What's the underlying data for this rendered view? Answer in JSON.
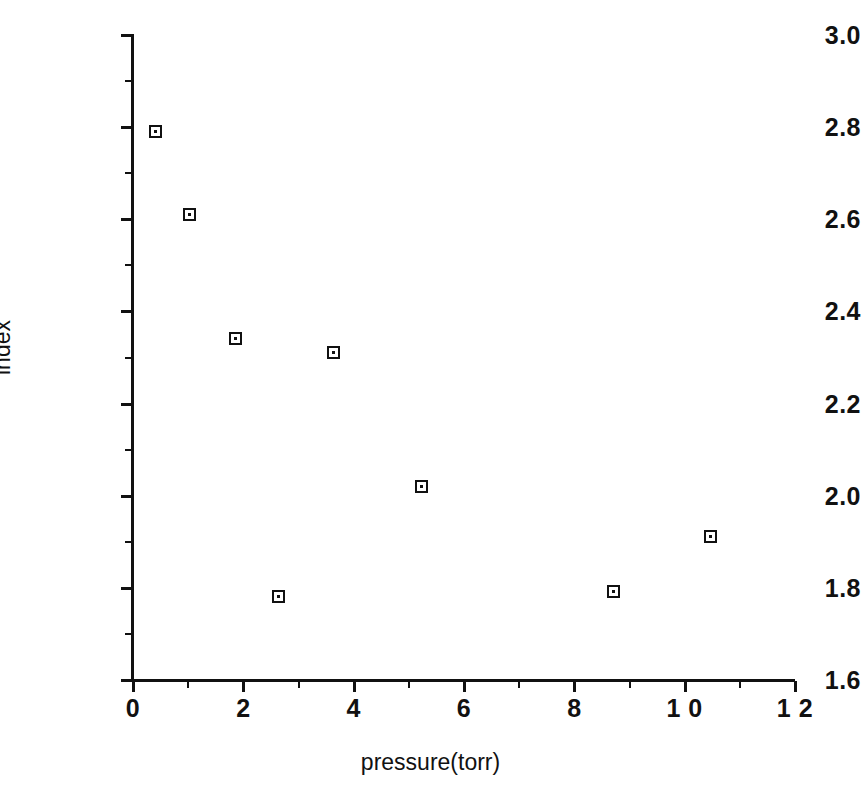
{
  "chart_data": {
    "type": "scatter",
    "title": "",
    "xlabel": "pressure(torr)",
    "ylabel": "index",
    "xlim": [
      0,
      12
    ],
    "ylim": [
      1.6,
      3.0
    ],
    "grid": false,
    "legend": null,
    "x_ticks": [
      {
        "value": 0,
        "label": "0",
        "minor": false
      },
      {
        "value": 1,
        "label": "",
        "minor": true
      },
      {
        "value": 2,
        "label": "2",
        "minor": false
      },
      {
        "value": 3,
        "label": "",
        "minor": true
      },
      {
        "value": 4,
        "label": "4",
        "minor": false
      },
      {
        "value": 5,
        "label": "",
        "minor": true
      },
      {
        "value": 6,
        "label": "6",
        "minor": false
      },
      {
        "value": 7,
        "label": "",
        "minor": true
      },
      {
        "value": 8,
        "label": "8",
        "minor": false
      },
      {
        "value": 9,
        "label": "",
        "minor": true
      },
      {
        "value": 10,
        "label": "1 0",
        "minor": false
      },
      {
        "value": 11,
        "label": "",
        "minor": true
      },
      {
        "value": 12,
        "label": "1 2",
        "minor": false
      }
    ],
    "y_ticks": [
      {
        "value": 1.6,
        "label": "1.6",
        "minor": false
      },
      {
        "value": 1.7,
        "label": "",
        "minor": true
      },
      {
        "value": 1.8,
        "label": "1.8",
        "minor": false
      },
      {
        "value": 1.9,
        "label": "",
        "minor": true
      },
      {
        "value": 2.0,
        "label": "2.0",
        "minor": false
      },
      {
        "value": 2.1,
        "label": "",
        "minor": true
      },
      {
        "value": 2.2,
        "label": "2.2",
        "minor": false
      },
      {
        "value": 2.3,
        "label": "",
        "minor": true
      },
      {
        "value": 2.4,
        "label": "2.4",
        "minor": false
      },
      {
        "value": 2.5,
        "label": "",
        "minor": true
      },
      {
        "value": 2.6,
        "label": "2.6",
        "minor": false
      },
      {
        "value": 2.7,
        "label": "",
        "minor": true
      },
      {
        "value": 2.8,
        "label": "2.8",
        "minor": false
      },
      {
        "value": 2.9,
        "label": "",
        "minor": true
      },
      {
        "value": 3.0,
        "label": "3.0",
        "minor": false
      }
    ],
    "series": [
      {
        "name": "index",
        "marker": "open-square-with-center-dot",
        "color": "#111111",
        "points": [
          {
            "x": 0.42,
            "y": 2.79
          },
          {
            "x": 1.04,
            "y": 2.61
          },
          {
            "x": 1.87,
            "y": 2.34
          },
          {
            "x": 2.64,
            "y": 1.78
          },
          {
            "x": 3.64,
            "y": 2.31
          },
          {
            "x": 5.24,
            "y": 2.02
          },
          {
            "x": 8.71,
            "y": 1.79
          },
          {
            "x": 10.47,
            "y": 1.91
          }
        ]
      }
    ]
  },
  "plot_geometry": {
    "left_px": 133,
    "right_px": 795,
    "top_px": 35,
    "bottom_px": 680
  }
}
